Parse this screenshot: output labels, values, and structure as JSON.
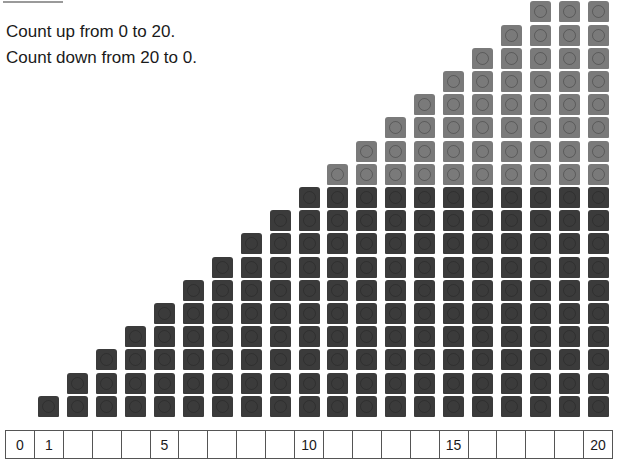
{
  "instructions": {
    "line1": "Count up from 0 to 20.",
    "line2": "Count down from 20 to 0."
  },
  "cube_columns": {
    "counts": [
      0,
      1,
      2,
      3,
      4,
      5,
      6,
      7,
      8,
      9,
      10,
      11,
      12,
      13,
      14,
      15,
      16,
      17,
      18,
      19,
      20
    ],
    "dark_limit": 10,
    "colors": {
      "dark": "#3b3b3b",
      "light": "#7a7a7a"
    }
  },
  "number_line": {
    "cells": [
      "0",
      "1",
      "",
      "",
      "",
      "5",
      "",
      "",
      "",
      "",
      "10",
      "",
      "",
      "",
      "",
      "15",
      "",
      "",
      "",
      "",
      "20"
    ]
  }
}
